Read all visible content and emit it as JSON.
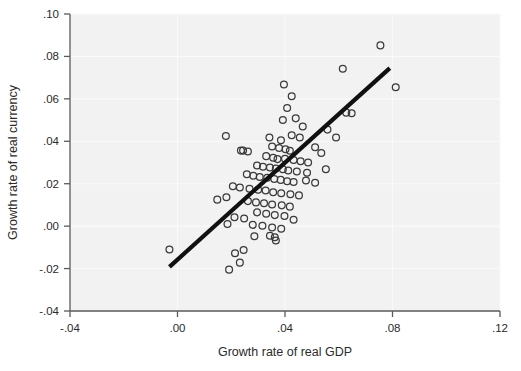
{
  "chart_data": {
    "type": "scatter",
    "title": "",
    "subtitle": "",
    "xlabel": "Growth rate of real GDP",
    "ylabel": "Growth rate of real currency",
    "xlim": [
      -0.04,
      0.12
    ],
    "ylim": [
      -0.04,
      0.1
    ],
    "xticks": [
      -0.04,
      0.0,
      0.04,
      0.08,
      0.12
    ],
    "xtick_labels": [
      "-.04",
      ".00",
      ".04",
      ".08",
      ".12"
    ],
    "yticks": [
      -0.04,
      -0.02,
      0.0,
      0.02,
      0.04,
      0.06,
      0.08,
      0.1
    ],
    "ytick_labels": [
      "-.04",
      "-.02",
      ".00",
      ".02",
      ".04",
      ".06",
      ".08",
      ".10"
    ],
    "grid": true,
    "legend": "none",
    "marker_style": "open-circle",
    "panel_color": "#f2f2f2",
    "grid_color": "#fafafa",
    "marker_color": "#3a3a3a",
    "fitline_color": "#111111",
    "fit_line": {
      "label": "linear fit",
      "x_start": -0.003,
      "y_start": -0.0192,
      "x_end": 0.079,
      "y_end": 0.0745
    },
    "points": [
      {
        "x": -0.003,
        "y": -0.011
      },
      {
        "x": 0.0755,
        "y": 0.0852
      },
      {
        "x": 0.0812,
        "y": 0.0655
      },
      {
        "x": 0.0615,
        "y": 0.0742
      },
      {
        "x": 0.0396,
        "y": 0.0668
      },
      {
        "x": 0.0425,
        "y": 0.0612
      },
      {
        "x": 0.0628,
        "y": 0.0535
      },
      {
        "x": 0.0648,
        "y": 0.0532
      },
      {
        "x": 0.0408,
        "y": 0.0557
      },
      {
        "x": 0.044,
        "y": 0.0508
      },
      {
        "x": 0.0392,
        "y": 0.05
      },
      {
        "x": 0.0466,
        "y": 0.047
      },
      {
        "x": 0.0558,
        "y": 0.0455
      },
      {
        "x": 0.018,
        "y": 0.0425
      },
      {
        "x": 0.059,
        "y": 0.0418
      },
      {
        "x": 0.0342,
        "y": 0.0418
      },
      {
        "x": 0.0425,
        "y": 0.0428
      },
      {
        "x": 0.0455,
        "y": 0.0418
      },
      {
        "x": 0.0385,
        "y": 0.0405
      },
      {
        "x": 0.0236,
        "y": 0.0356
      },
      {
        "x": 0.0244,
        "y": 0.0356
      },
      {
        "x": 0.0262,
        "y": 0.0352
      },
      {
        "x": 0.0352,
        "y": 0.0375
      },
      {
        "x": 0.0378,
        "y": 0.0368
      },
      {
        "x": 0.0402,
        "y": 0.0362
      },
      {
        "x": 0.0418,
        "y": 0.0355
      },
      {
        "x": 0.0512,
        "y": 0.0372
      },
      {
        "x": 0.0535,
        "y": 0.0345
      },
      {
        "x": 0.033,
        "y": 0.033
      },
      {
        "x": 0.0356,
        "y": 0.0322
      },
      {
        "x": 0.0372,
        "y": 0.0316
      },
      {
        "x": 0.04,
        "y": 0.0318
      },
      {
        "x": 0.0432,
        "y": 0.0312
      },
      {
        "x": 0.0458,
        "y": 0.0306
      },
      {
        "x": 0.0486,
        "y": 0.03
      },
      {
        "x": 0.0296,
        "y": 0.0286
      },
      {
        "x": 0.0318,
        "y": 0.028
      },
      {
        "x": 0.0344,
        "y": 0.0276
      },
      {
        "x": 0.0366,
        "y": 0.0272
      },
      {
        "x": 0.0392,
        "y": 0.0268
      },
      {
        "x": 0.0412,
        "y": 0.0262
      },
      {
        "x": 0.0444,
        "y": 0.0258
      },
      {
        "x": 0.0482,
        "y": 0.0252
      },
      {
        "x": 0.0552,
        "y": 0.0268
      },
      {
        "x": 0.0258,
        "y": 0.0245
      },
      {
        "x": 0.0282,
        "y": 0.0238
      },
      {
        "x": 0.0306,
        "y": 0.0232
      },
      {
        "x": 0.0334,
        "y": 0.0228
      },
      {
        "x": 0.036,
        "y": 0.0222
      },
      {
        "x": 0.0384,
        "y": 0.0218
      },
      {
        "x": 0.0408,
        "y": 0.0212
      },
      {
        "x": 0.0432,
        "y": 0.0208
      },
      {
        "x": 0.0478,
        "y": 0.0215
      },
      {
        "x": 0.0512,
        "y": 0.0205
      },
      {
        "x": 0.0206,
        "y": 0.0188
      },
      {
        "x": 0.0232,
        "y": 0.0182
      },
      {
        "x": 0.0268,
        "y": 0.0176
      },
      {
        "x": 0.03,
        "y": 0.0172
      },
      {
        "x": 0.0328,
        "y": 0.0168
      },
      {
        "x": 0.0356,
        "y": 0.016
      },
      {
        "x": 0.0386,
        "y": 0.0155
      },
      {
        "x": 0.042,
        "y": 0.015
      },
      {
        "x": 0.0452,
        "y": 0.0145
      },
      {
        "x": 0.0148,
        "y": 0.0125
      },
      {
        "x": 0.0182,
        "y": 0.0136
      },
      {
        "x": 0.0262,
        "y": 0.0118
      },
      {
        "x": 0.0292,
        "y": 0.0112
      },
      {
        "x": 0.0322,
        "y": 0.0108
      },
      {
        "x": 0.0352,
        "y": 0.0102
      },
      {
        "x": 0.0388,
        "y": 0.0098
      },
      {
        "x": 0.0418,
        "y": 0.0092
      },
      {
        "x": 0.0296,
        "y": 0.0065
      },
      {
        "x": 0.033,
        "y": 0.0058
      },
      {
        "x": 0.0362,
        "y": 0.0052
      },
      {
        "x": 0.0398,
        "y": 0.0048
      },
      {
        "x": 0.0212,
        "y": 0.0042
      },
      {
        "x": 0.0248,
        "y": 0.0036
      },
      {
        "x": 0.0432,
        "y": 0.003
      },
      {
        "x": 0.0186,
        "y": 0.001
      },
      {
        "x": 0.028,
        "y": 0.0006
      },
      {
        "x": 0.0316,
        "y": 0.0002
      },
      {
        "x": 0.0352,
        "y": -0.0006
      },
      {
        "x": 0.0386,
        "y": -0.0012
      },
      {
        "x": 0.0286,
        "y": -0.0048
      },
      {
        "x": 0.0344,
        "y": -0.0045
      },
      {
        "x": 0.0362,
        "y": -0.0052
      },
      {
        "x": 0.0366,
        "y": -0.0068
      },
      {
        "x": 0.0246,
        "y": -0.0112
      },
      {
        "x": 0.0214,
        "y": -0.0128
      },
      {
        "x": 0.0192,
        "y": -0.0205
      },
      {
        "x": 0.0232,
        "y": -0.0172
      }
    ]
  }
}
